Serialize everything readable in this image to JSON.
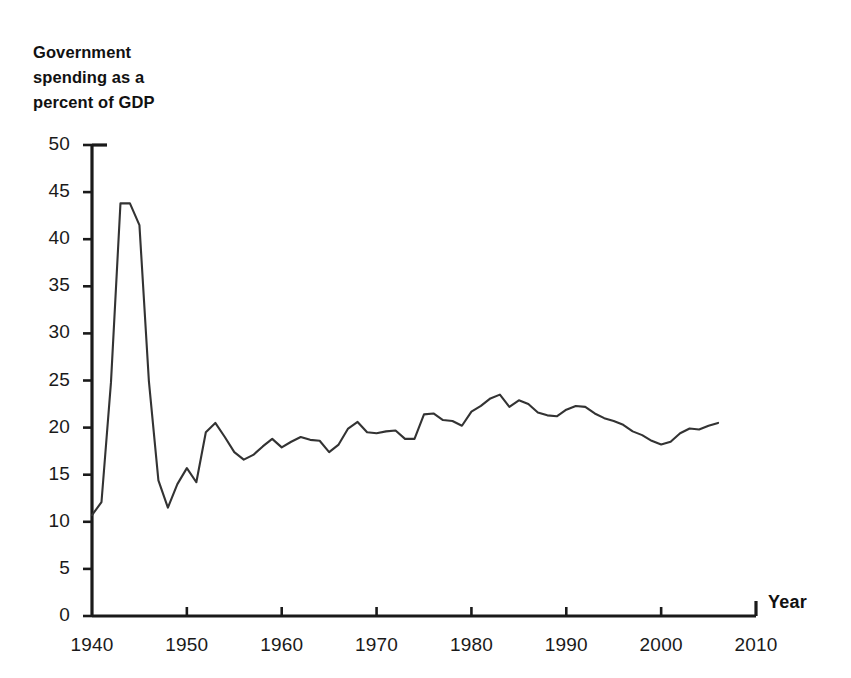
{
  "chart_data": {
    "type": "line",
    "title": "Government spending as a percent of GDP",
    "title_lines": "Government\nspending as a\npercent of GDP",
    "xlabel": "Year",
    "ylabel": "",
    "xlim": [
      1940,
      2010
    ],
    "ylim": [
      0,
      50
    ],
    "grid": false,
    "legend": null,
    "line_color": "#333333",
    "x_ticks": [
      1940,
      1950,
      1960,
      1970,
      1980,
      1990,
      2000,
      2010
    ],
    "y_ticks": [
      0,
      5,
      10,
      15,
      20,
      25,
      30,
      35,
      40,
      45,
      50
    ],
    "x_tick_labels": [
      "1940",
      "1950",
      "1960",
      "1970",
      "1980",
      "1990",
      "2000",
      "2010"
    ],
    "y_tick_labels": [
      "0",
      "5",
      "10",
      "15",
      "20",
      "25",
      "30",
      "35",
      "40",
      "45",
      "50"
    ],
    "series": [
      {
        "name": "Government spending as a percent of GDP",
        "x": [
          1940,
          1941,
          1942,
          1943,
          1944,
          1945,
          1946,
          1947,
          1948,
          1949,
          1950,
          1951,
          1952,
          1953,
          1954,
          1955,
          1956,
          1957,
          1958,
          1959,
          1960,
          1961,
          1962,
          1963,
          1964,
          1965,
          1966,
          1967,
          1968,
          1969,
          1970,
          1971,
          1972,
          1973,
          1974,
          1975,
          1976,
          1977,
          1978,
          1979,
          1980,
          1981,
          1982,
          1983,
          1984,
          1985,
          1986,
          1987,
          1988,
          1989,
          1990,
          1991,
          1992,
          1993,
          1994,
          1995,
          1996,
          1997,
          1998,
          1999,
          2000,
          2001,
          2002,
          2003,
          2004,
          2005,
          2006
        ],
        "values": [
          10.7,
          12.1,
          24.8,
          43.8,
          43.8,
          41.5,
          24.9,
          14.4,
          11.5,
          14.0,
          15.7,
          14.2,
          19.5,
          20.5,
          19.0,
          17.4,
          16.6,
          17.1,
          18.0,
          18.8,
          17.9,
          18.5,
          19.0,
          18.7,
          18.6,
          17.4,
          18.2,
          19.9,
          20.6,
          19.5,
          19.4,
          19.6,
          19.7,
          18.8,
          18.8,
          21.4,
          21.5,
          20.8,
          20.7,
          20.2,
          21.7,
          22.3,
          23.1,
          23.5,
          22.2,
          22.9,
          22.5,
          21.6,
          21.3,
          21.2,
          21.9,
          22.3,
          22.2,
          21.5,
          21.0,
          20.7,
          20.3,
          19.6,
          19.2,
          18.6,
          18.2,
          18.5,
          19.4,
          19.9,
          19.8,
          20.2,
          20.5
        ]
      }
    ]
  },
  "axis": {
    "x_title": "Year"
  }
}
